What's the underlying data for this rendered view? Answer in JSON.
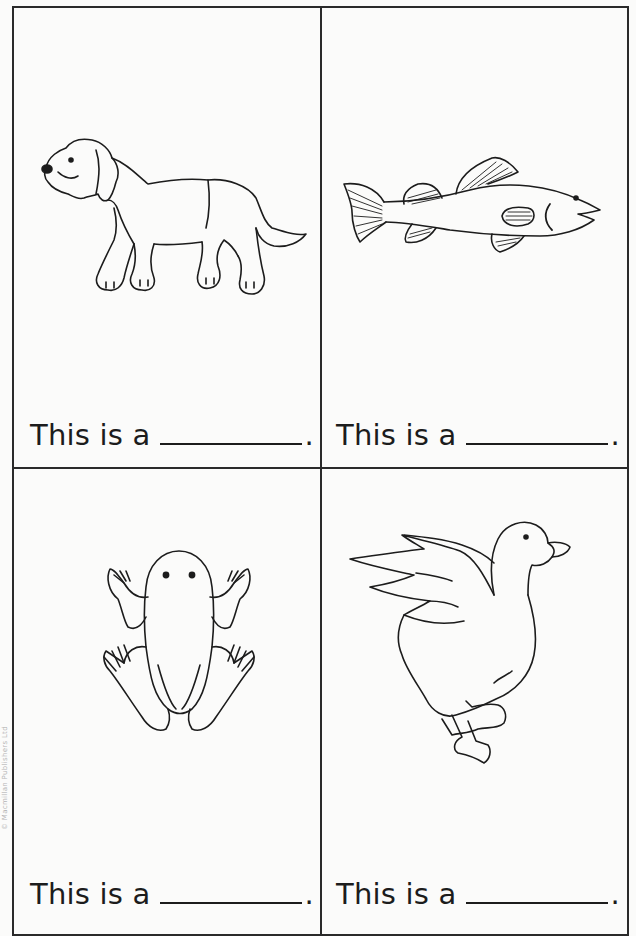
{
  "worksheet": {
    "cells": [
      {
        "animal": "dog",
        "caption_prefix": "This is a",
        "period": "."
      },
      {
        "animal": "fish",
        "caption_prefix": "This is a",
        "period": "."
      },
      {
        "animal": "frog",
        "caption_prefix": "This is a",
        "period": "."
      },
      {
        "animal": "duck",
        "caption_prefix": "This is a",
        "period": "."
      }
    ],
    "copyright": "© Macmillan Publishers Ltd"
  },
  "colors": {
    "ink": "#1c1c1c",
    "border": "#2a2a2a",
    "paper": "#fbfbfa"
  }
}
